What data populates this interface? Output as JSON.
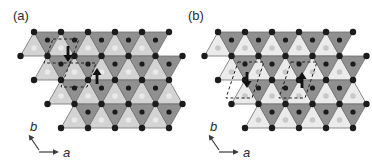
{
  "figure": {
    "type": "crystal-structure-diagram",
    "background": "#ffffff",
    "width": 372,
    "height": 165
  },
  "lattice": {
    "side": 27,
    "rowHeight": 24,
    "top": 32,
    "apexStart": 34,
    "rowShift": 13.5,
    "rows": [
      {
        "n": 5,
        "trail": true
      },
      {
        "n": 5,
        "trail": true
      },
      {
        "n": 5,
        "trail": false
      },
      {
        "n": 4,
        "trail": true
      }
    ]
  },
  "colors": {
    "background": "#ffffff",
    "down_triangle": "#909090",
    "edge": "#707070",
    "atom": "#1b1b1b",
    "down_center_dot": "#1b1b1b",
    "dash": "#222222",
    "spin_arrow": "#111111",
    "text": "#2b2b2b"
  },
  "panels": [
    {
      "label": "(a)",
      "label_pos": [
        13,
        20
      ],
      "offset_x": 0,
      "up_fill": "#d3d3d3",
      "up_dot": "#e9e9e9",
      "unit_cells": [
        [
          [
            53,
            39
          ],
          [
            79,
            39
          ],
          [
            70,
            63
          ],
          [
            44,
            63
          ]
        ],
        [
          [
            70,
            63
          ],
          [
            96,
            63
          ],
          [
            87,
            87
          ],
          [
            61,
            87
          ]
        ]
      ],
      "spin_arrows": [
        {
          "x": 68,
          "y_from": 46,
          "y_to": 62,
          "direction": "down"
        },
        {
          "x": 97,
          "y_from": 84,
          "y_to": 68,
          "direction": "up"
        }
      ],
      "axis_origin": [
        39,
        152
      ]
    },
    {
      "label": "(b)",
      "label_pos": [
        188,
        20
      ],
      "offset_x": 184,
      "up_fill": "#ebebeb",
      "up_dot": "#c8c8c8",
      "unit_cells": [
        [
          [
            238,
            62
          ],
          [
            264,
            62
          ],
          [
            252,
            98
          ],
          [
            226,
            98
          ]
        ],
        [
          [
            291,
            62
          ],
          [
            317,
            62
          ],
          [
            305,
            98
          ],
          [
            279,
            98
          ]
        ]
      ],
      "spin_arrows": [
        {
          "x": 247,
          "y_from": 72,
          "y_to": 88,
          "direction": "down"
        },
        {
          "x": 302,
          "y_from": 88,
          "y_to": 72,
          "direction": "up"
        }
      ],
      "axis_origin": [
        219,
        152
      ]
    }
  ],
  "axis": {
    "a_label": "a",
    "b_label": "b"
  }
}
